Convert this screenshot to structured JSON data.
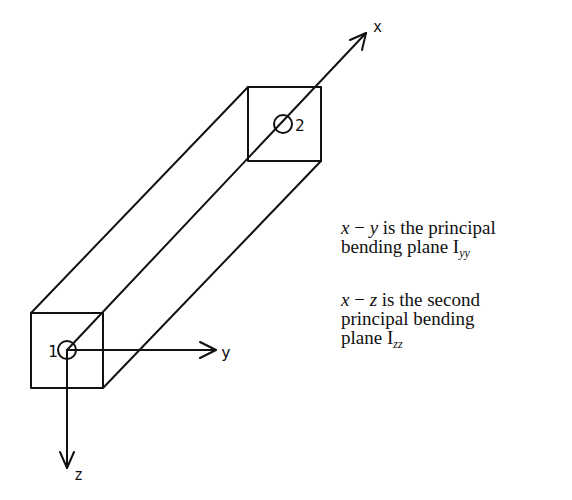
{
  "diagram": {
    "type": "beam-element-axes",
    "nodes": [
      {
        "id": "1",
        "label": "1"
      },
      {
        "id": "2",
        "label": "2"
      }
    ],
    "axes": {
      "x": "x",
      "y": "y",
      "z": "z"
    },
    "colors": {
      "line": "#111111",
      "background": "#ffffff"
    }
  },
  "captions": {
    "xy": {
      "var1": "x",
      "dash": " − ",
      "var2": "y",
      "line1_rest": " is the principal",
      "line2": "bending plane I",
      "subscript": "yy"
    },
    "xz": {
      "var1": "x",
      "dash": " − ",
      "var2": "z",
      "line1_rest": " is the second",
      "line2": "principal bending",
      "line3": "plane I",
      "subscript": "zz"
    }
  }
}
